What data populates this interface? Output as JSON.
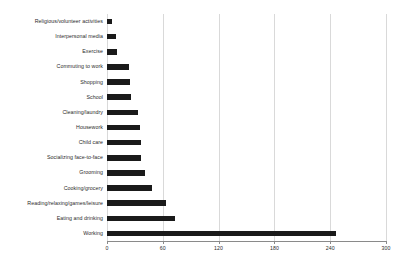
{
  "chart_data": {
    "type": "bar",
    "orientation": "horizontal",
    "title": "",
    "subtitle": "",
    "xlabel": "",
    "ylabel": "",
    "xlim": [
      0,
      300
    ],
    "ylim": null,
    "grid": true,
    "grid_axis": "x",
    "legend": false,
    "legend_position": "none",
    "bar_color": "#1a1a1a",
    "background_color": "#ffffff",
    "gridline_color": "#d9d9d9",
    "axis_color": "#8a8a8a",
    "xticks": [
      0,
      60,
      120,
      180,
      240,
      300
    ],
    "xtick_labels": [
      "0",
      "60",
      "120",
      "180",
      "240",
      "300"
    ],
    "categories": [
      "Religious/volunteer activities",
      "Interpersonal media",
      "Exercise",
      "Commuting to work",
      "Shopping",
      "School",
      "Cleaning/laundry",
      "Housework",
      "Child care",
      "Socializing face-to-face",
      "Grooming",
      "Cooking/grocery",
      "Reading/relaxing/games/leisure",
      "Eating and drinking",
      "Working"
    ],
    "values": [
      5,
      10,
      11,
      24,
      25,
      26,
      33,
      35,
      37,
      37,
      41,
      48,
      63,
      73,
      246
    ]
  }
}
